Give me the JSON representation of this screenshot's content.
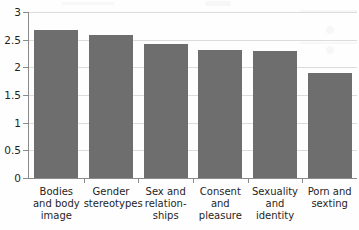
{
  "chart_data": {
    "type": "bar",
    "title": "",
    "subtitle": "",
    "xlabel": "",
    "ylabel": "",
    "categories": [
      "Bodies\nand body\nimage",
      "Gender\nstereotypes",
      "Sex and\nrelation-\nships",
      "Consent\nand\npleasure",
      "Sexuality\nand\nidentity",
      "Porn and\nsexting"
    ],
    "values": [
      2.68,
      2.58,
      2.42,
      2.31,
      2.3,
      1.9
    ],
    "ylim": [
      0,
      3
    ],
    "ytick_labels": [
      "0",
      "0.5",
      "1",
      "1.5",
      "2",
      "2.5",
      "3"
    ],
    "ytick_values": [
      0,
      0.5,
      1,
      1.5,
      2,
      2.5,
      3
    ],
    "grid": true,
    "legend": "none",
    "bar_color": "#6e6e6e",
    "grid_color": "#dcdcdc",
    "axis_color": "#8a8a8a"
  }
}
